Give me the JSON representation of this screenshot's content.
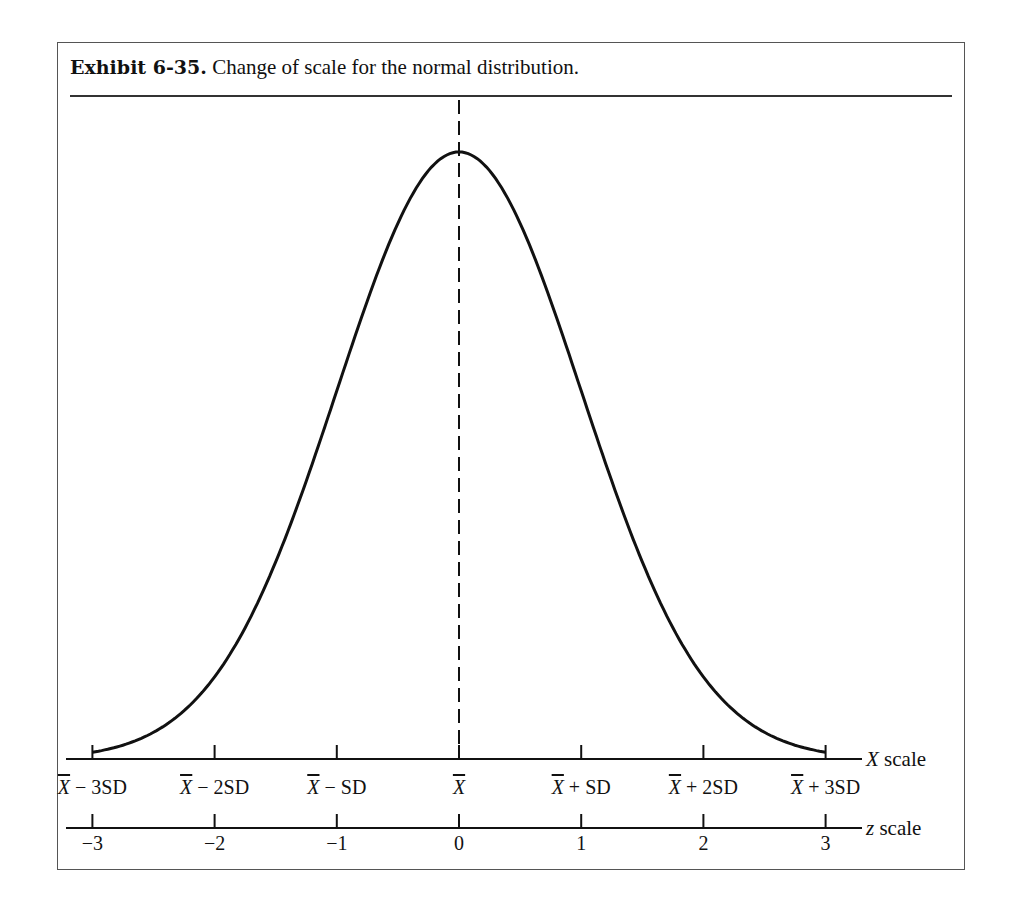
{
  "title": {
    "label": "Exhibit 6-35.",
    "text": "Change of scale for the normal distribution."
  },
  "chart_data": {
    "type": "line",
    "title": "Change of scale for the normal distribution.",
    "series": [
      {
        "name": "normal density",
        "x": [
          -3,
          -2.5,
          -2,
          -1.5,
          -1,
          -0.5,
          0,
          0.5,
          1,
          1.5,
          2,
          2.5,
          3
        ],
        "y": [
          0.0044,
          0.0175,
          0.054,
          0.1295,
          0.242,
          0.3521,
          0.3989,
          0.3521,
          0.242,
          0.1295,
          0.054,
          0.0175,
          0.0044
        ]
      }
    ],
    "mean_line": {
      "x": 0,
      "style": "dashed"
    },
    "axes": [
      {
        "name": "X scale",
        "ticks": [
          -3,
          -2,
          -1,
          0,
          1,
          2,
          3
        ],
        "tick_labels": [
          "X̄ − 3SD",
          "X̄ − 2SD",
          "X̄ − SD",
          "X̄",
          "X̄ + SD",
          "X̄ + 2SD",
          "X̄ + 3SD"
        ]
      },
      {
        "name": "z scale",
        "ticks": [
          -3,
          -2,
          -1,
          0,
          1,
          2,
          3
        ],
        "tick_labels": [
          "−3",
          "−2",
          "−1",
          "0",
          "1",
          "2",
          "3"
        ]
      }
    ],
    "xlim": [
      -3,
      3
    ],
    "grid": false,
    "legend": "none"
  },
  "x_scale": {
    "name_var": "X",
    "name_word": "scale",
    "labels": [
      {
        "bar": "X",
        "rest": " − 3SD"
      },
      {
        "bar": "X",
        "rest": " − 2SD"
      },
      {
        "bar": "X",
        "rest": " − SD"
      },
      {
        "bar": "X",
        "rest": ""
      },
      {
        "bar": "X",
        "rest": " + SD"
      },
      {
        "bar": "X",
        "rest": " + 2SD"
      },
      {
        "bar": "X",
        "rest": " + 3SD"
      }
    ]
  },
  "z_scale": {
    "name_var": "z",
    "name_word": "scale",
    "labels": [
      "−3",
      "−2",
      "−1",
      "0",
      "1",
      "2",
      "3"
    ]
  },
  "colors": {
    "ink": "#111111",
    "frame": "#555555"
  }
}
